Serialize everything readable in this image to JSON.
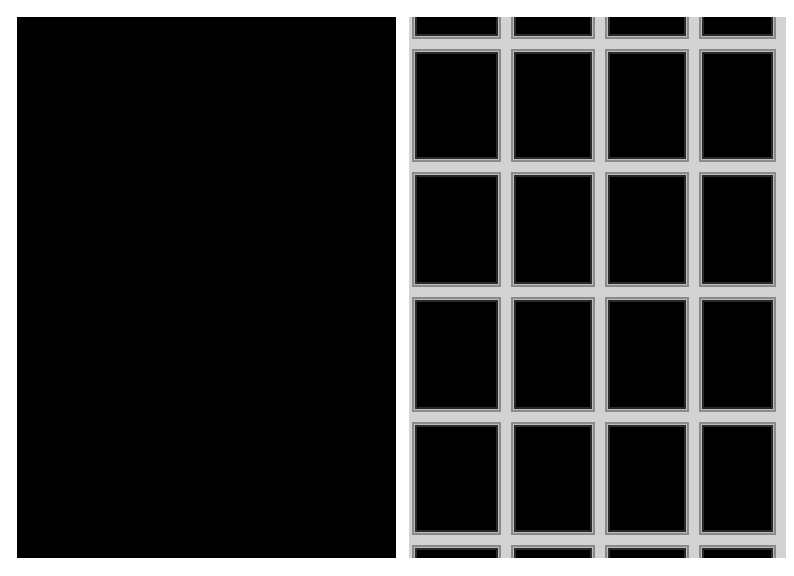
{
  "image": {
    "width": 794,
    "height": 576,
    "background": "#ffffff",
    "panels": [
      {
        "id": "left",
        "subject": "high-contrast crackled texture (white network on black)",
        "x": 17,
        "y": 17,
        "width": 379,
        "height": 541,
        "colors": {
          "base": "#000000",
          "pattern": "#ffffff"
        }
      },
      {
        "id": "right",
        "subject": "building facade grid of dark window panes with light mullions",
        "x": 409,
        "y": 17,
        "width": 377,
        "height": 541,
        "grid": {
          "columns": 4,
          "rows_visible": 6,
          "col_edges": [
            3,
            97,
            191,
            285,
            372
          ],
          "row_edges": [
            -12,
            27,
            150,
            275,
            400,
            523,
            560
          ]
        },
        "colors": {
          "pane": "#000000",
          "frame": "#d2d2d2",
          "pane_edge": "#8a8a8a"
        }
      }
    ]
  }
}
